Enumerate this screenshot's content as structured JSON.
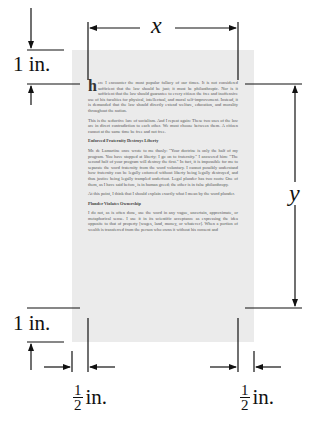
{
  "diagram": {
    "labels": {
      "width": "x",
      "height": "y",
      "top_margin": "1 in.",
      "bottom_margin": "1 in.",
      "left_margin_num": "1",
      "left_margin_den": "2",
      "left_margin_unit": "in.",
      "right_margin_num": "1",
      "right_margin_den": "2",
      "right_margin_unit": "in."
    }
  },
  "page_text": {
    "dropcap": "h",
    "p1": "ere I encounter the most popular fallacy of our times. It is not considered sufficient that the law should be just; it must be philanthropic. Nor is it sufficient that the law should guarantee to every citizen the free and inoffensive use of his faculties for physical, intellectual, and moral self-improvement. Instead, it is demanded that the law should directly extend welfare, education, and morality throughout the nation.",
    "p2": "This is the seductive lure of socialism. And I repeat again: These two uses of the law are in direct contradiction to each other. We must choose between them. A citizen cannot at the same time be free and not free.",
    "h1": "Enforced Fraternity Destroys Liberty",
    "p3": "Mr. de Lamartine once wrote to me thusly: \"Your doctrine is only the half of my program. You have stopped at liberty; I go on to fraternity.\" I answered him: \"The second half of your program will destroy the first.\" In fact, it is impossible for me to separate the word fraternity from the word voluntary. I cannot possibly understand how fraternity can be legally enforced without liberty being legally destroyed, and thus justice being legally trampled underfoot. Legal plunder has two roots: One of them, as I have said before, is in human greed; the other is in false philanthropy.",
    "p4": "At this point, I think that I should explain exactly what I mean by the word plunder.",
    "h2": "Plunder Violates Ownership",
    "p5": "I do not, as is often done, use the word in any vague, uncertain, approximate, or metaphorical sense. I use it in its scientific acceptance as expressing the idea opposite to that of property [wages, land, money, or whatever]. When a portion of wealth is transferred from the person who owns it without his consent and"
  }
}
